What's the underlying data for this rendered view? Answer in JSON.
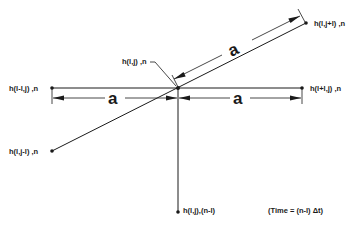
{
  "diagram": {
    "type": "finite-difference stencil",
    "nodes": {
      "center": {
        "label": "h(l,j) ,n"
      },
      "left": {
        "label": "h(l-l,j) ,n"
      },
      "right": {
        "label": "h(l+l,j) ,n"
      },
      "upper_right": {
        "label": "h(l,j+l) ,n"
      },
      "lower_left": {
        "label": "h(l,j-l) ,n"
      },
      "bottom": {
        "label": "h(l,j),(n-l)"
      }
    },
    "dimensions": {
      "left_spacing": "a",
      "right_spacing": "a",
      "diagonal_spacing": "a"
    },
    "note": "(Time = (n-l) Δt)",
    "colors": {
      "ink": "#1a1a1a",
      "background": "#ffffff"
    }
  }
}
